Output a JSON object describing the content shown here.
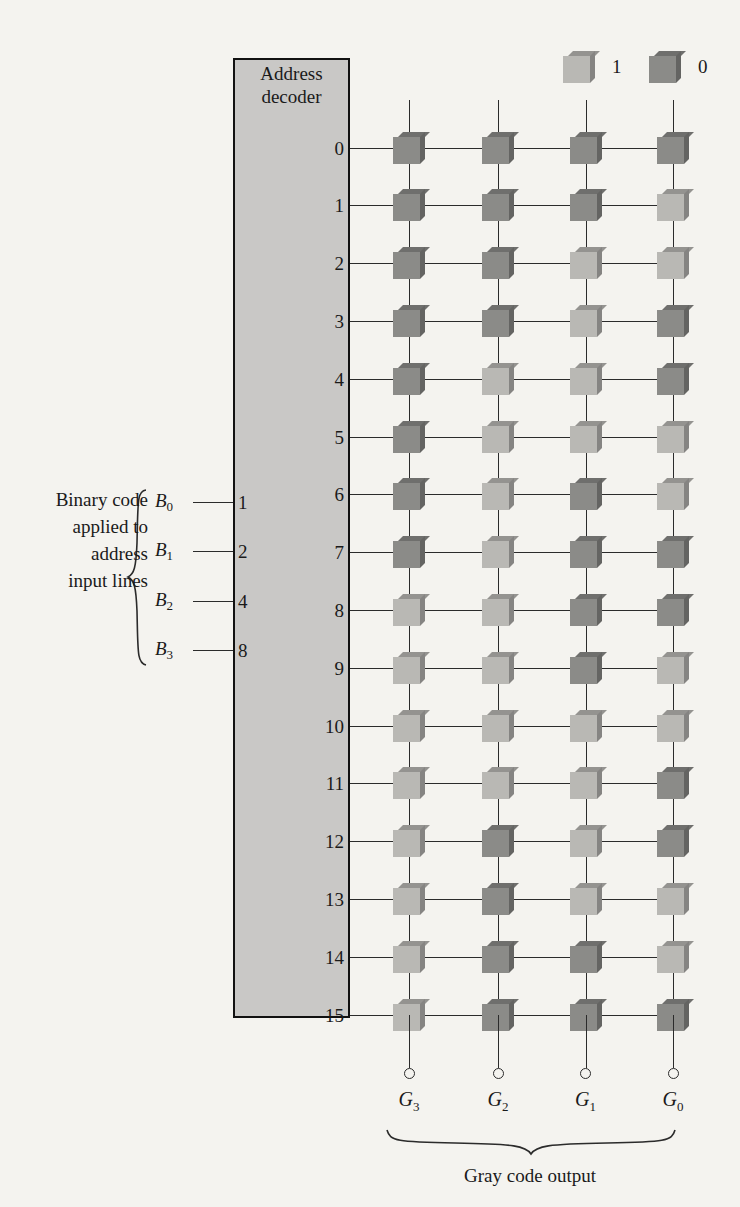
{
  "legend": {
    "items": [
      {
        "label": "1",
        "value": 1,
        "icon": "light-cube-icon",
        "color": "#b9b8b4"
      },
      {
        "label": "0",
        "value": 0,
        "icon": "dark-cube-icon",
        "color": "#8b8b88"
      }
    ]
  },
  "decoder": {
    "title": "Address\ndecoder",
    "title_line1": "Address",
    "title_line2": "decoder",
    "fill_color": "#c9c8c6",
    "border_color": "#111111",
    "output_rows": [
      "0",
      "1",
      "2",
      "3",
      "4",
      "5",
      "6",
      "7",
      "8",
      "9",
      "10",
      "11",
      "12",
      "13",
      "14",
      "15"
    ]
  },
  "inputs": {
    "caption": "Binary code applied to address input lines",
    "caption_lines": [
      "Binary code",
      "applied to",
      "address",
      "input lines"
    ],
    "lines": [
      {
        "name": "B",
        "subscript": "0",
        "weight": "1"
      },
      {
        "name": "B",
        "subscript": "1",
        "weight": "2"
      },
      {
        "name": "B",
        "subscript": "2",
        "weight": "4"
      },
      {
        "name": "B",
        "subscript": "3",
        "weight": "8"
      }
    ]
  },
  "outputs": {
    "caption": "Gray code output",
    "lines": [
      {
        "name": "G",
        "subscript": "3"
      },
      {
        "name": "G",
        "subscript": "2"
      },
      {
        "name": "G",
        "subscript": "1"
      },
      {
        "name": "G",
        "subscript": "0"
      }
    ]
  },
  "chart_data": {
    "type": "table",
    "title": "Gray code output",
    "columns": [
      "G3",
      "G2",
      "G1",
      "G0"
    ],
    "row_labels": [
      "0",
      "1",
      "2",
      "3",
      "4",
      "5",
      "6",
      "7",
      "8",
      "9",
      "10",
      "11",
      "12",
      "13",
      "14",
      "15"
    ],
    "values": [
      [
        0,
        0,
        0,
        0
      ],
      [
        0,
        0,
        0,
        1
      ],
      [
        0,
        0,
        1,
        1
      ],
      [
        0,
        0,
        1,
        0
      ],
      [
        0,
        1,
        1,
        0
      ],
      [
        0,
        1,
        1,
        1
      ],
      [
        0,
        1,
        0,
        1
      ],
      [
        0,
        1,
        0,
        0
      ],
      [
        1,
        1,
        0,
        0
      ],
      [
        1,
        1,
        0,
        1
      ],
      [
        1,
        1,
        1,
        1
      ],
      [
        1,
        1,
        1,
        0
      ],
      [
        1,
        0,
        1,
        0
      ],
      [
        1,
        0,
        1,
        1
      ],
      [
        1,
        0,
        0,
        1
      ],
      [
        1,
        0,
        0,
        0
      ]
    ],
    "encoding": {
      "1": "light gray cube",
      "0": "dark gray cube"
    }
  }
}
